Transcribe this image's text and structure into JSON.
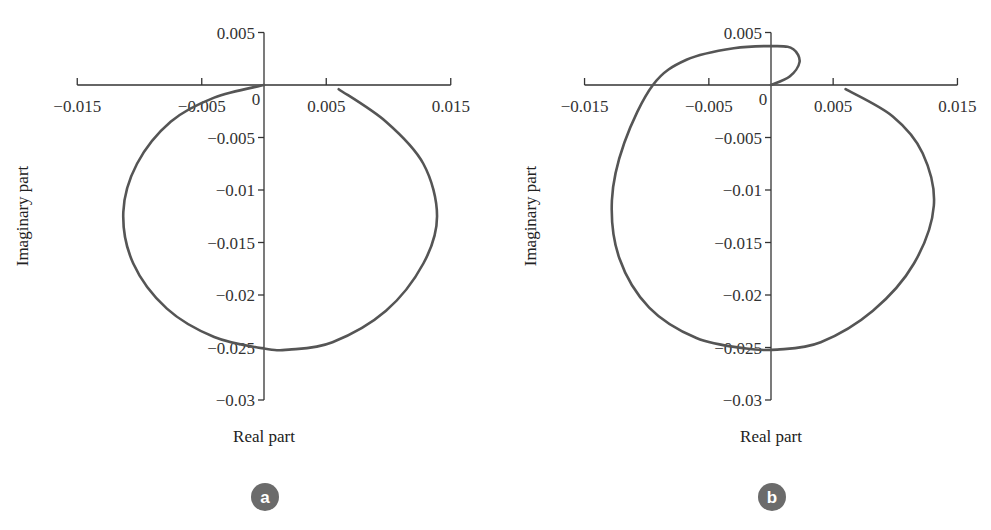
{
  "panels": [
    {
      "id": "a",
      "badge": "a",
      "xlabel": "Real part",
      "ylabel": "Imaginary part",
      "x_ticks": [
        "−0.015",
        "−0.005",
        "0",
        "0.005",
        "0.015"
      ],
      "y_ticks": [
        "0.005",
        "−0.005",
        "−0.01",
        "−0.015",
        "−0.02",
        "−0.025",
        "−0.03"
      ]
    },
    {
      "id": "b",
      "badge": "b",
      "xlabel": "Real part",
      "ylabel": "Imaginary part",
      "x_ticks": [
        "−0.015",
        "−0.005",
        "0",
        "0.005",
        "0.015"
      ],
      "y_ticks": [
        "0.005",
        "−0.005",
        "−0.01",
        "−0.015",
        "−0.02",
        "−0.025",
        "−0.03"
      ]
    }
  ],
  "colors": {
    "curve": "#555555",
    "axis": "#333333",
    "badge": "#6b6b6b"
  },
  "chart_data": [
    {
      "type": "line",
      "title": "a",
      "xlabel": "Real part",
      "ylabel": "Imaginary part",
      "xlim": [
        -0.015,
        0.015
      ],
      "ylim": [
        -0.03,
        0.005
      ],
      "x_ticks": [
        -0.015,
        -0.005,
        0,
        0.005,
        0.015
      ],
      "y_ticks": [
        0.005,
        0,
        -0.005,
        -0.01,
        -0.015,
        -0.02,
        -0.025,
        -0.03
      ],
      "grid": false,
      "series": [
        {
          "name": "Nyquist locus (a)",
          "x": [
            0.0,
            -0.004,
            -0.0075,
            -0.0102,
            -0.0113,
            -0.0105,
            -0.0078,
            -0.004,
            0.0,
            0.002,
            0.0055,
            0.0098,
            0.0128,
            0.0139,
            0.0128,
            0.0098,
            0.006
          ],
          "y": [
            0.0,
            -0.0012,
            -0.0035,
            -0.0075,
            -0.0121,
            -0.017,
            -0.0213,
            -0.024,
            -0.0251,
            -0.0252,
            -0.0245,
            -0.0215,
            -0.017,
            -0.0125,
            -0.0075,
            -0.0035,
            -0.0004
          ]
        }
      ]
    },
    {
      "type": "line",
      "title": "b",
      "xlabel": "Real part",
      "ylabel": "Imaginary part",
      "xlim": [
        -0.015,
        0.015
      ],
      "ylim": [
        -0.03,
        0.005
      ],
      "x_ticks": [
        -0.015,
        -0.005,
        0,
        0.005,
        0.015
      ],
      "y_ticks": [
        0.005,
        0,
        -0.005,
        -0.01,
        -0.015,
        -0.02,
        -0.025,
        -0.03
      ],
      "grid": false,
      "series": [
        {
          "name": "Nyquist locus (b)",
          "x": [
            0.0,
            0.0015,
            0.0023,
            0.0018,
            0.0005,
            -0.003,
            -0.0068,
            -0.0095,
            -0.0118,
            -0.0128,
            -0.0122,
            -0.0098,
            -0.006,
            -0.002,
            0.0005,
            0.004,
            0.0082,
            0.0115,
            0.0131,
            0.0122,
            0.0098,
            0.006
          ],
          "y": [
            0.0,
            0.0008,
            0.0022,
            0.0034,
            0.0037,
            0.0035,
            0.0024,
            0.0,
            -0.0055,
            -0.011,
            -0.0165,
            -0.0212,
            -0.0241,
            -0.0251,
            -0.0252,
            -0.0245,
            -0.0215,
            -0.017,
            -0.0115,
            -0.0065,
            -0.003,
            -0.0004
          ]
        }
      ]
    }
  ]
}
